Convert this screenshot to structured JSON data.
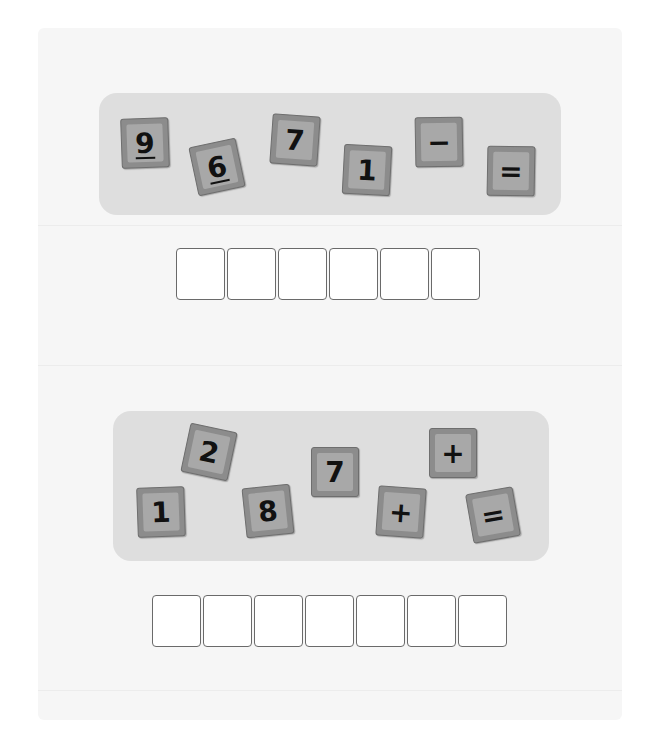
{
  "puzzles": [
    {
      "tiles": [
        {
          "label": "9",
          "underlined": true,
          "x": 121,
          "y": 118,
          "rot": -2
        },
        {
          "label": "6",
          "underlined": true,
          "x": 193,
          "y": 142,
          "rot": -12
        },
        {
          "label": "7",
          "underlined": false,
          "x": 271,
          "y": 115,
          "rot": 4
        },
        {
          "label": "1",
          "underlined": false,
          "x": 343,
          "y": 145,
          "rot": 3
        },
        {
          "label": "−",
          "underlined": false,
          "x": 415,
          "y": 117,
          "rot": -1
        },
        {
          "label": "=",
          "underlined": false,
          "x": 487,
          "y": 146,
          "rot": 1
        }
      ],
      "answer_cells": 6
    },
    {
      "tiles": [
        {
          "label": "2",
          "underlined": false,
          "x": 185,
          "y": 427,
          "rot": 12
        },
        {
          "label": "1",
          "underlined": false,
          "x": 137,
          "y": 487,
          "rot": -2
        },
        {
          "label": "8",
          "underlined": false,
          "x": 244,
          "y": 486,
          "rot": -6
        },
        {
          "label": "7",
          "underlined": false,
          "x": 311,
          "y": 447,
          "rot": 0
        },
        {
          "label": "+",
          "underlined": false,
          "x": 377,
          "y": 487,
          "rot": 4
        },
        {
          "label": "+",
          "underlined": false,
          "x": 429,
          "y": 428,
          "rot": 0
        },
        {
          "label": "=",
          "underlined": false,
          "x": 469,
          "y": 490,
          "rot": -10
        }
      ],
      "answer_cells": 7
    }
  ],
  "colors": {
    "tile_face": "#a8a8a8",
    "tile_border": "#8c8c8c",
    "tray": "#dedede",
    "sheet": "#f6f6f6"
  }
}
